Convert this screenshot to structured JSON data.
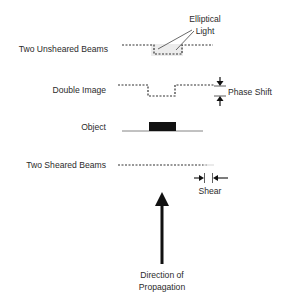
{
  "diagram": {
    "rows": [
      {
        "id": "unsheared",
        "label": "Two Unsheared Beams"
      },
      {
        "id": "double-image",
        "label": "Double Image"
      },
      {
        "id": "object",
        "label": "Object"
      },
      {
        "id": "sheared",
        "label": "Two Sheared Beams"
      }
    ],
    "annotations": {
      "elliptical_light_line1": "Elliptical",
      "elliptical_light_line2": "Light",
      "phase_shift": "Phase Shift",
      "shear": "Shear",
      "direction_line1": "Direction of",
      "direction_line2": "Propagation"
    },
    "colors": {
      "line": "#333333",
      "object_fill": "#111111",
      "object_base": "#777777",
      "highlight": "#e6e6e6",
      "arrow": "#111111"
    }
  }
}
